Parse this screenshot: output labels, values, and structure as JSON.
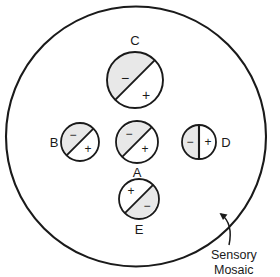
{
  "figure": {
    "name": "sensory-mosaic-receptive-field-diagram",
    "outer_region_label": "Sensory Mosaic",
    "background_color": "#ffffff",
    "stroke_color": "#1a1a1a",
    "shade_color": "#e8e8e8",
    "positive_sign": "+",
    "negative_sign": "−"
  },
  "units": [
    {
      "id": "A",
      "label": "A",
      "label_position": "below",
      "divider": "diagonal",
      "shaded_half": "upper-left",
      "shaded_sign": "−",
      "unshaded_sign": "+",
      "cx": 137,
      "cy": 142,
      "r": 21
    },
    {
      "id": "B",
      "label": "B",
      "label_position": "left",
      "divider": "diagonal",
      "shaded_half": "upper-left",
      "shaded_sign": "−",
      "unshaded_sign": "+",
      "cx": 80,
      "cy": 142,
      "r": 19
    },
    {
      "id": "C",
      "label": "C",
      "label_position": "above",
      "divider": "diagonal",
      "shaded_half": "upper-left",
      "shaded_sign": "−",
      "unshaded_sign": "+",
      "cx": 135,
      "cy": 80,
      "r": 28
    },
    {
      "id": "D",
      "label": "D",
      "label_position": "right",
      "divider": "vertical",
      "shaded_half": "left",
      "shaded_sign": "−",
      "unshaded_sign": "+",
      "cx": 199,
      "cy": 142,
      "r": 17
    },
    {
      "id": "E",
      "label": "E",
      "label_position": "below",
      "divider": "diagonal",
      "shaded_half": "lower-right",
      "shaded_sign": "−",
      "unshaded_sign": "+",
      "cx": 139,
      "cy": 199,
      "r": 20
    }
  ],
  "outer_circle": {
    "cx": 136,
    "cy": 136.5,
    "r": 130
  },
  "annotation": {
    "line1": "Sensory",
    "line2": "Mosaic",
    "arrow_name": "callout-arrow"
  }
}
